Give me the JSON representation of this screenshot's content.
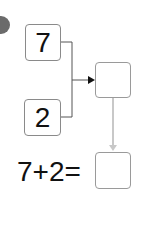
{
  "marker": {
    "icon": "grey-circle-bullet"
  },
  "inputs": [
    {
      "value": "7"
    },
    {
      "value": "2"
    }
  ],
  "result_box": {
    "value": ""
  },
  "equation": {
    "text": "7+2=",
    "answer": ""
  },
  "colors": {
    "box_border": "#9a9a9a",
    "connector": "#555555",
    "down_arrow": "#c8c8c8",
    "text": "#111111"
  }
}
